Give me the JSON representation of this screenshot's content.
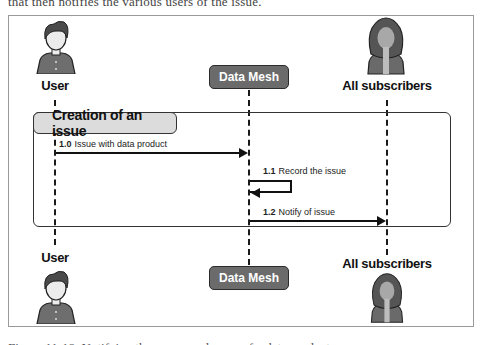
{
  "caption_top_partial": "that then notifies the various users of the issue.",
  "caption_bottom_partial": "Figure 11-18. Notifying the owner and users of a data product",
  "actors": {
    "user": {
      "label": "User",
      "icon": "man-avatar-icon"
    },
    "data_mesh": {
      "label": "Data Mesh"
    },
    "subscribers": {
      "label": "All subscribers",
      "icon": "woman-avatar-icon"
    }
  },
  "fragment": {
    "label": "Creation of an issue"
  },
  "messages": [
    {
      "number": "1.0",
      "text": "Issue with data product",
      "from": "User",
      "to": "Data Mesh"
    },
    {
      "number": "1.1",
      "text": "Record the issue",
      "from": "Data Mesh",
      "to": "Data Mesh"
    },
    {
      "number": "1.2",
      "text": "Notify of issue",
      "from": "Data Mesh",
      "to": "All subscribers"
    }
  ],
  "colors": {
    "actor_box": "#6b6b6b",
    "fragment_label_bg": "#dcdcdc",
    "line": "#111111"
  }
}
